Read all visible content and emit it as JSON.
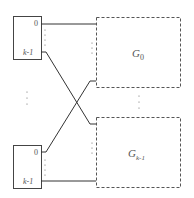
{
  "diagram": {
    "inputs": [
      {
        "id": "top-switch",
        "port_first": "0",
        "port_last": "k-1"
      },
      {
        "id": "bottom-switch",
        "port_first": "0",
        "port_last": "k-1"
      }
    ],
    "groups": [
      {
        "id": "G0",
        "label_main": "G",
        "label_sub": "0"
      },
      {
        "id": "Gk-1",
        "label_main": "G",
        "label_sub": "k-1"
      }
    ],
    "ellipsis": "⋮",
    "colors": {
      "line": "#333333",
      "dash": "#555555",
      "text": "#555555"
    }
  }
}
